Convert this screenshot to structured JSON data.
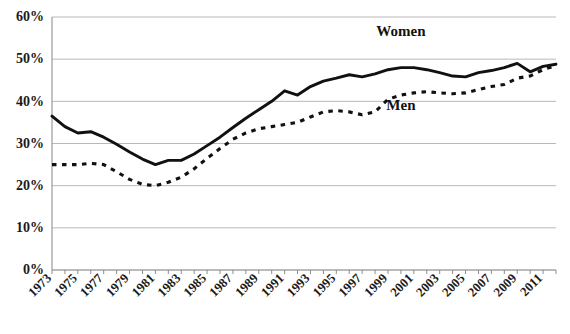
{
  "chart_data": {
    "type": "line",
    "title": "",
    "xlabel": "",
    "ylabel": "",
    "ylim": [
      0,
      60
    ],
    "xlim": [
      1973,
      2012
    ],
    "grid": true,
    "legend_position": "inline-annotation",
    "y_ticks": [
      "0%",
      "10%",
      "20%",
      "30%",
      "40%",
      "50%",
      "60%"
    ],
    "y_tick_values": [
      0,
      10,
      20,
      30,
      40,
      50,
      60
    ],
    "x_tick_labels": [
      "1973",
      "1975",
      "1977",
      "1979",
      "1981",
      "1983",
      "1985",
      "1987",
      "1989",
      "1991",
      "1993",
      "1995",
      "1997",
      "1999",
      "2001",
      "2003",
      "2005",
      "2007",
      "2009",
      "2011"
    ],
    "x_minor_tick_years": [
      1973,
      1974,
      1975,
      1976,
      1977,
      1978,
      1979,
      1980,
      1981,
      1982,
      1983,
      1984,
      1985,
      1986,
      1987,
      1988,
      1989,
      1990,
      1991,
      1992,
      1993,
      1994,
      1995,
      1996,
      1997,
      1998,
      1999,
      2000,
      2001,
      2002,
      2003,
      2004,
      2005,
      2006,
      2007,
      2008,
      2009,
      2010,
      2011,
      2012
    ],
    "x": [
      1973,
      1974,
      1975,
      1976,
      1977,
      1978,
      1979,
      1980,
      1981,
      1982,
      1983,
      1984,
      1985,
      1986,
      1987,
      1988,
      1989,
      1990,
      1991,
      1992,
      1993,
      1994,
      1995,
      1996,
      1997,
      1998,
      1999,
      2000,
      2001,
      2002,
      2003,
      2004,
      2005,
      2006,
      2007,
      2008,
      2009,
      2010,
      2011,
      2012
    ],
    "series": [
      {
        "name": "Women",
        "style": "solid",
        "color": "#111111",
        "values": [
          36.5,
          34.0,
          32.5,
          32.8,
          31.5,
          29.8,
          28.0,
          26.3,
          25.0,
          26.0,
          26.0,
          27.5,
          29.5,
          31.5,
          33.8,
          36.0,
          38.0,
          40.0,
          42.5,
          41.5,
          43.5,
          44.8,
          45.5,
          46.3,
          45.8,
          46.5,
          47.5,
          48.0,
          48.0,
          47.5,
          46.8,
          46.0,
          45.8,
          46.8,
          47.3,
          48.0,
          49.0,
          47.0,
          48.3,
          48.8
        ]
      },
      {
        "name": "Men",
        "style": "dashed",
        "color": "#111111",
        "values": [
          25.0,
          25.0,
          25.0,
          25.3,
          25.0,
          23.3,
          21.5,
          20.3,
          20.0,
          20.8,
          22.0,
          24.0,
          26.5,
          28.8,
          31.0,
          32.5,
          33.5,
          34.0,
          34.5,
          35.0,
          36.3,
          37.5,
          37.8,
          37.5,
          36.8,
          37.5,
          40.5,
          41.5,
          42.0,
          42.3,
          42.0,
          41.8,
          42.0,
          42.8,
          43.5,
          44.0,
          45.5,
          46.0,
          47.5,
          48.5
        ]
      }
    ],
    "annotations": [
      {
        "text": "Women",
        "x": 2000,
        "y": 55.5
      },
      {
        "text": "Men",
        "x": 2000,
        "y": 38.0
      }
    ]
  }
}
